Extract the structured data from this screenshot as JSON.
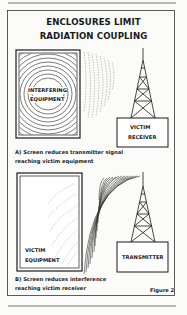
{
  "title": {
    "line1": "ENCLOSURES LIMIT",
    "line2": "RADIATION COUPLING"
  },
  "panel_a": {
    "source_label_line1": "INTERFERING",
    "source_label_line2": "EQUIPMENT",
    "receiver_label_line1": "VICTIM",
    "receiver_label_line2": "RECEIVER",
    "caption_line1": "A) Screen reduces transmitter signal",
    "caption_line2": "reaching victim equipment"
  },
  "panel_b": {
    "victim_label_line1": "VICTIM",
    "victim_label_line2": "EQUIPMENT",
    "transmitter_label": "TRANSMITTER",
    "caption_line1": "B) Screen reduces interference",
    "caption_line2": "reaching victim receiver"
  },
  "figure_label": "Figure 2",
  "colors": {
    "ink": "#1a1a1a",
    "paper": "#fbfbf9",
    "wave": "#555555"
  }
}
